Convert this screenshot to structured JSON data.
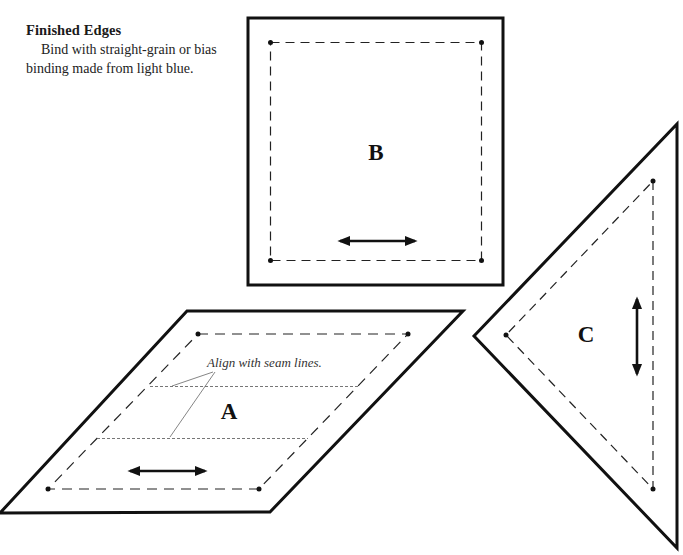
{
  "section": {
    "heading": "Finished Edges",
    "body": "Bind with straight-grain or bias binding made from light blue."
  },
  "pieces": [
    {
      "id": "A",
      "label": "A",
      "shape": "parallelogram",
      "grainline": "horizontal"
    },
    {
      "id": "B",
      "label": "B",
      "shape": "square",
      "grainline": "horizontal"
    },
    {
      "id": "C",
      "label": "C",
      "shape": "triangle",
      "grainline": "vertical"
    }
  ],
  "annotations": {
    "seam_note": "Align with seam lines."
  },
  "legend": {
    "solid_line": "cutting line",
    "dashed_line": "seam line",
    "arrow": "grainline"
  }
}
